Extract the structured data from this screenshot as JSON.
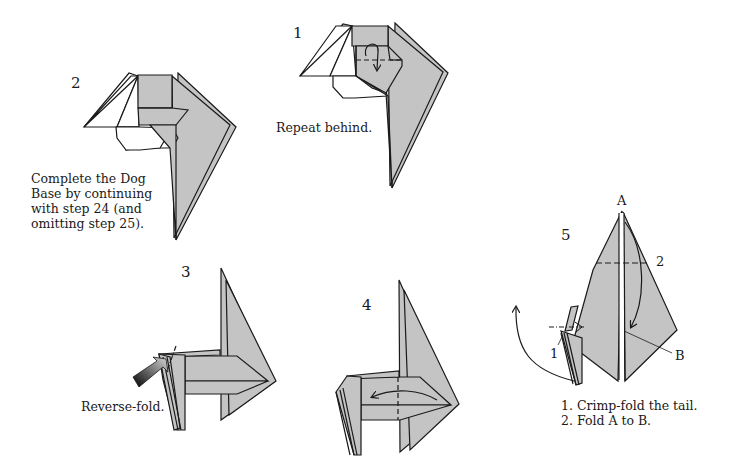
{
  "colors": {
    "paper_gray": "#c4c4c4",
    "line": "#1a1a1a",
    "background": "#ffffff"
  },
  "steps": [
    {
      "number": "1",
      "caption": "Repeat behind.",
      "symbols": [
        "valley-fold-dashed-line",
        "fold-over-arrow"
      ]
    },
    {
      "number": "2",
      "caption_lines": [
        "Complete the Dog",
        "Base by continuing",
        "with step 24 (and",
        "omitting step 25)."
      ]
    },
    {
      "number": "3",
      "caption": "Reverse-fold.",
      "symbols": [
        "push-arrow",
        "reverse-fold-dash-dot-line"
      ]
    },
    {
      "number": "4",
      "symbols": [
        "valley-fold-dashed-line",
        "fold-arrow-left"
      ]
    },
    {
      "number": "5",
      "point_labels": {
        "a": "A",
        "b": "B",
        "fold_1": "1",
        "fold_2": "2"
      },
      "caption_lines": [
        "1. Crimp-fold the tail.",
        "2. Fold A to B."
      ],
      "symbols": [
        "crimp-fold-arrow",
        "valley-fold-dashed-line",
        "fold-arrow-down"
      ]
    }
  ]
}
